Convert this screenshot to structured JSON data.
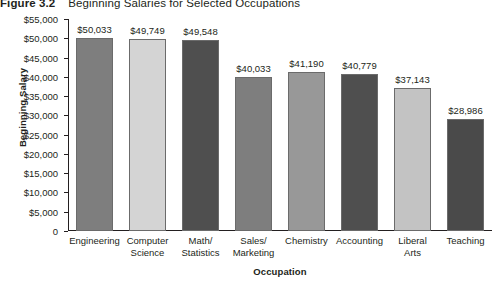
{
  "caption": {
    "label": "Figure 3.2",
    "text": "Beginning Salaries for Selected Occupations"
  },
  "chart_data": {
    "type": "bar",
    "title": "Beginning Salaries for Selected Occupations",
    "xlabel": "Occupation",
    "ylabel": "Beginning Salary",
    "ylim": [
      0,
      55000
    ],
    "ytick_step": 5000,
    "grid": false,
    "legend": null,
    "categories": [
      "Engineering",
      "Computer Science",
      "Math/ Statistics",
      "Sales/ Marketing",
      "Chemistry",
      "Accounting",
      "Liberal Arts",
      "Teaching"
    ],
    "category_lines": [
      [
        "Engineering"
      ],
      [
        "Computer",
        "Science"
      ],
      [
        "Math/",
        "Statistics"
      ],
      [
        "Sales/",
        "Marketing"
      ],
      [
        "Chemistry"
      ],
      [
        "Accounting"
      ],
      [
        "Liberal",
        "Arts"
      ],
      [
        "Teaching"
      ]
    ],
    "values": [
      50033,
      49749,
      49548,
      40033,
      41190,
      40779,
      37143,
      28986
    ],
    "value_labels": [
      "$50,033",
      "$49,749",
      "$49,548",
      "$40,033",
      "$41,190",
      "$40,779",
      "$37,143",
      "$28,986"
    ],
    "bar_colors": [
      "#7e7e7e",
      "#d4d4d4",
      "#4f4f4f",
      "#7e7e7e",
      "#989898",
      "#4f4f4f",
      "#c3c3c3",
      "#4a4a4a"
    ],
    "ytick_labels": [
      "$55,000",
      "$50,000",
      "$45,000",
      "$40,000",
      "$35,000",
      "$30,000",
      "$25,000",
      "$20,000",
      "$15,000",
      "$10,000",
      "$5,000",
      "0"
    ],
    "ytick_values": [
      55000,
      50000,
      45000,
      40000,
      35000,
      30000,
      25000,
      20000,
      15000,
      10000,
      5000,
      0
    ]
  }
}
